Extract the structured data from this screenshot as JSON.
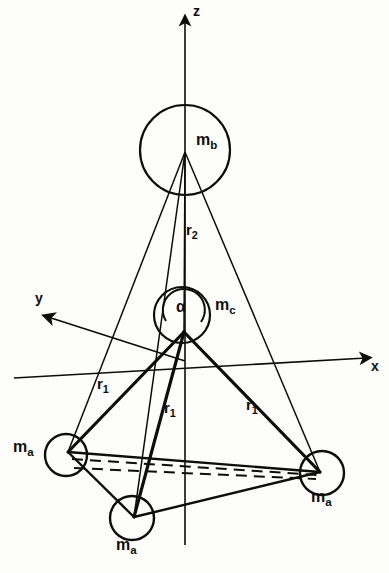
{
  "figure": {
    "background_color": "#fdfdfb",
    "ink_color": "#0d0d0d"
  },
  "axes": [
    {
      "name": "z-axis",
      "label": "z",
      "label_x": 193,
      "label_y": 9,
      "direction": "up"
    },
    {
      "name": "y-axis",
      "label": "y",
      "label_x": 35,
      "label_y": 296,
      "direction": "up-left"
    },
    {
      "name": "x-axis",
      "label": "x",
      "label_x": 372,
      "label_y": 362,
      "direction": "right"
    }
  ],
  "masses": [
    {
      "id": "m-b",
      "symbol": "m",
      "subscript": "b",
      "label_x": 196,
      "label_y": 140,
      "cx": 185,
      "cy": 150,
      "r": 45
    },
    {
      "id": "m-c",
      "symbol": "m",
      "subscript": "c",
      "label_x": 216,
      "label_y": 304,
      "cx": 182,
      "cy": 315,
      "r": 28
    },
    {
      "id": "m-a-left",
      "symbol": "m",
      "subscript": "a",
      "label_x": 14,
      "label_y": 446,
      "cx": 66,
      "cy": 455,
      "r": 21
    },
    {
      "id": "m-a-right",
      "symbol": "m",
      "subscript": "a",
      "label_x": 312,
      "label_y": 496,
      "cx": 322,
      "cy": 473,
      "r": 22
    },
    {
      "id": "m-a-bottom",
      "symbol": "m",
      "subscript": "a",
      "label_x": 117,
      "label_y": 544,
      "cx": 132,
      "cy": 518,
      "r": 22
    }
  ],
  "distance_labels": [
    {
      "id": "r2",
      "symbol": "r",
      "subscript": "2",
      "label_x": 186,
      "label_y": 228
    },
    {
      "id": "r1-left",
      "symbol": "r",
      "subscript": "1",
      "label_x": 97,
      "label_y": 382
    },
    {
      "id": "r1-middle",
      "symbol": "r",
      "subscript": "1",
      "label_x": 164,
      "label_y": 406
    },
    {
      "id": "r1-right",
      "symbol": "r",
      "subscript": "1",
      "label_x": 246,
      "label_y": 403
    }
  ],
  "angle": {
    "id": "alpha",
    "glyph": "α",
    "label_x": 176,
    "label_y": 305,
    "vertex_x": 184,
    "vertex_y": 332,
    "arc_radius": 21
  },
  "geometry": {
    "apex_b": {
      "x": 185,
      "y": 152
    },
    "apex_c": {
      "x": 184,
      "y": 332
    },
    "vertex_a_left": {
      "x": 68,
      "y": 452
    },
    "vertex_a_right": {
      "x": 320,
      "y": 472
    },
    "vertex_a_bottom": {
      "x": 134,
      "y": 517
    },
    "z_axis": {
      "x1": 185,
      "y1": 18,
      "x2": 185,
      "y2": 545
    },
    "y_axis": {
      "x1": 182,
      "y1": 360,
      "x2": 46,
      "y2": 316
    },
    "x_axis": {
      "x1": 14,
      "y1": 378,
      "x2": 368,
      "y2": 358
    }
  }
}
